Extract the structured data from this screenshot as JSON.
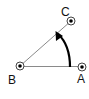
{
  "diagram": {
    "type": "angle-diagram",
    "points": [
      {
        "id": "A",
        "label": "A",
        "x": 82,
        "y": 67,
        "label_x": 77,
        "label_y": 83
      },
      {
        "id": "B",
        "label": "B",
        "x": 20,
        "y": 66,
        "label_x": 9,
        "label_y": 84
      },
      {
        "id": "C",
        "label": "C",
        "x": 71,
        "y": 21,
        "label_x": 61,
        "label_y": 16
      }
    ],
    "segments": [
      {
        "from": "B",
        "to": "A"
      },
      {
        "from": "B",
        "to": "C"
      }
    ],
    "arrow": {
      "from": "A-side",
      "to": "C-side",
      "description": "curved rotation arrow from BA toward BC"
    },
    "colors": {
      "line": "#8a8a8a",
      "arrow": "#000000",
      "point": "#000000",
      "background": "#ffffff"
    }
  }
}
